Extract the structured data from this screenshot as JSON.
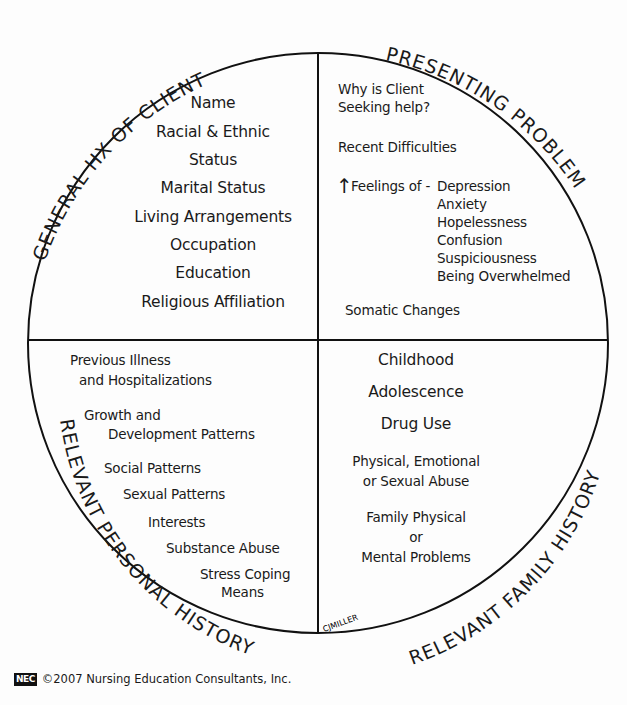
{
  "quadrants": {
    "top_left": {
      "title": "GENERAL HX OF CLIENT",
      "items": [
        "Name",
        "Racial & Ethnic",
        "Status",
        "Marital Status",
        "Living Arrangements",
        "Occupation",
        "Education",
        "Religious Affiliation"
      ]
    },
    "top_right": {
      "title": "PRESENTING PROBLEM",
      "why_line1": "Why is Client",
      "why_line2": "Seeking help?",
      "recent": "Recent Difficulties",
      "feelings_arrow": "↑",
      "feelings_label": "Feelings of -",
      "feelings": [
        "Depression",
        "Anxiety",
        "Hopelessness",
        "Confusion",
        "Suspiciousness",
        "Being Overwhelmed"
      ],
      "somatic": "Somatic Changes"
    },
    "bottom_left": {
      "title": "RELEVANT PERSONAL HISTORY",
      "items": [
        "Previous Illness",
        "and Hospitalizations",
        "Growth and",
        "Development Patterns",
        "Social Patterns",
        "Sexual Patterns",
        "Interests",
        "Substance Abuse",
        "Stress Coping",
        "Means"
      ]
    },
    "bottom_right": {
      "title": "RELEVANT FAMILY HISTORY",
      "items": [
        "Childhood",
        "Adolescence",
        "Drug Use",
        "Physical, Emotional",
        "or Sexual Abuse",
        "Family Physical",
        "or",
        "Mental Problems"
      ]
    }
  },
  "signature": "CJMILLER",
  "footer": {
    "logo": "NEC",
    "text": "©2007 Nursing Education Consultants, Inc."
  }
}
